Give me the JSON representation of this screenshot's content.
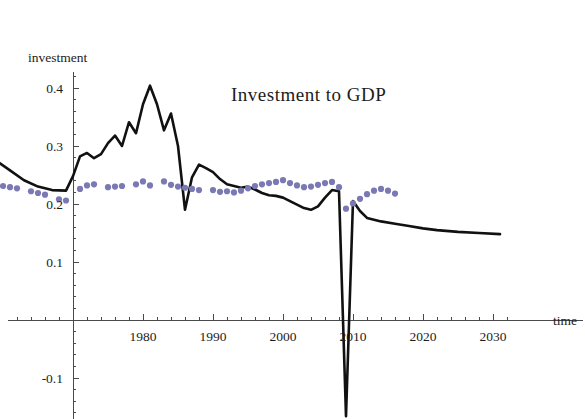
{
  "chart_data": {
    "type": "line",
    "title": "Investment to GDP",
    "xlabel": "time",
    "ylabel": "investment",
    "xlim": [
      1955,
      2032
    ],
    "ylim": [
      -0.17,
      0.44
    ],
    "grid": false,
    "legend": "none",
    "x_ticks_major": [
      1980,
      1990,
      2000,
      2010,
      2020,
      2030
    ],
    "x_tick_labels": [
      "1980",
      "1990",
      "2000",
      "2010",
      "2020",
      "2030"
    ],
    "x_ticks_minor_step": 2,
    "y_ticks_major": [
      0.4,
      0.3,
      0.2,
      0.1,
      -0.1
    ],
    "y_tick_labels": [
      "0.4",
      "0.3",
      "0.2",
      "0.1",
      "-0.1"
    ],
    "y_ticks_minor_step": 0.02,
    "series": [
      {
        "name": "model-solid-line",
        "style": "solid",
        "color": "#111111",
        "x": [
          1955,
          1957,
          1959,
          1961,
          1963,
          1965,
          1967,
          1969,
          1970,
          1971,
          1972,
          1973,
          1974,
          1975,
          1976,
          1977,
          1978,
          1979,
          1980,
          1981,
          1982,
          1983,
          1984,
          1985,
          1986,
          1987,
          1988,
          1989,
          1990,
          1991,
          1992,
          1993,
          1994,
          1995,
          1996,
          1997,
          1998,
          1999,
          2000,
          2001,
          2002,
          2003,
          2004,
          2005,
          2006,
          2007,
          2008,
          2009,
          2010,
          2011,
          2012,
          2014,
          2016,
          2018,
          2020,
          2022,
          2025,
          2028,
          2031
        ],
        "y": [
          0.268,
          0.281,
          0.275,
          0.258,
          0.241,
          0.23,
          0.224,
          0.223,
          0.248,
          0.282,
          0.288,
          0.279,
          0.286,
          0.305,
          0.318,
          0.3,
          0.341,
          0.322,
          0.372,
          0.404,
          0.372,
          0.327,
          0.356,
          0.3,
          0.19,
          0.246,
          0.268,
          0.262,
          0.255,
          0.243,
          0.234,
          0.231,
          0.228,
          0.23,
          0.225,
          0.219,
          0.215,
          0.214,
          0.211,
          0.205,
          0.199,
          0.193,
          0.19,
          0.196,
          0.211,
          0.224,
          0.222,
          -0.166,
          0.205,
          0.188,
          0.176,
          0.17,
          0.166,
          0.162,
          0.158,
          0.155,
          0.152,
          0.15,
          0.148
        ]
      },
      {
        "name": "data-dotted-series",
        "style": "dots",
        "color": "#7b79b4",
        "x": [
          1956,
          1957,
          1958,
          1960,
          1961,
          1962,
          1964,
          1965,
          1966,
          1968,
          1969,
          1971,
          1972,
          1973,
          1975,
          1976,
          1977,
          1979,
          1980,
          1981,
          1983,
          1984,
          1985,
          1986,
          1987,
          1988,
          1990,
          1991,
          1992,
          1993,
          1994,
          1995,
          1996,
          1997,
          1998,
          1999,
          2000,
          2001,
          2002,
          2003,
          2004,
          2005,
          2006,
          2007,
          2008,
          2009,
          2010,
          2011,
          2012,
          2013,
          2014,
          2015,
          2016
        ],
        "y": [
          0.234,
          0.229,
          0.226,
          0.231,
          0.229,
          0.227,
          0.222,
          0.219,
          0.216,
          0.208,
          0.206,
          0.226,
          0.232,
          0.234,
          0.229,
          0.23,
          0.231,
          0.234,
          0.239,
          0.232,
          0.239,
          0.233,
          0.23,
          0.228,
          0.226,
          0.224,
          0.224,
          0.221,
          0.222,
          0.22,
          0.223,
          0.227,
          0.231,
          0.234,
          0.236,
          0.238,
          0.241,
          0.236,
          0.232,
          0.229,
          0.23,
          0.233,
          0.236,
          0.238,
          0.229,
          0.192,
          0.201,
          0.209,
          0.217,
          0.223,
          0.226,
          0.223,
          0.218
        ]
      }
    ]
  },
  "labels": {
    "title": "Investment to GDP",
    "y_axis_name": "investment",
    "x_axis_name": "time"
  }
}
